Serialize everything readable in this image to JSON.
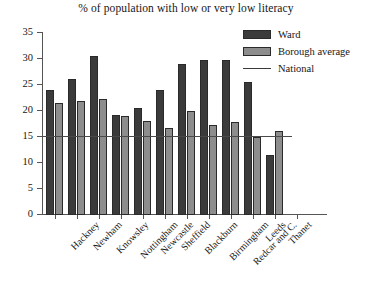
{
  "chart_data": {
    "type": "bar",
    "title": "% of population with low or very low literacy",
    "xlabel": "",
    "ylabel": "",
    "ylim": [
      0,
      35
    ],
    "ytick_step": 5,
    "yticks": [
      0,
      5,
      10,
      15,
      20,
      25,
      30,
      35
    ],
    "grid": false,
    "legend_position": "top-right",
    "categories": [
      "Hackney",
      "Newham",
      "Knowsley",
      "Nottingham",
      "Newcastle",
      "Sheffield",
      "Blackburn",
      "Birmingham",
      "Redcar and C.",
      "Leeds",
      "Thanet"
    ],
    "series": [
      {
        "name": "Ward",
        "color": "#3b3b3b",
        "values": [
          24.0,
          26.2,
          30.5,
          19.3,
          20.5,
          24.0,
          29.1,
          29.9,
          29.9,
          25.6,
          11.6
        ]
      },
      {
        "name": "Borough average",
        "color": "#8d8d8d",
        "values": [
          21.5,
          22.0,
          22.3,
          19.0,
          18.0,
          16.7,
          20.0,
          17.3,
          17.8,
          15.0,
          16.1
        ]
      }
    ],
    "reference_line": {
      "name": "National",
      "value": 15,
      "color": "#4a4a4a"
    }
  },
  "legend": {
    "items": [
      {
        "label": "Ward",
        "kind": "swatch-dark"
      },
      {
        "label": "Borough average",
        "kind": "swatch-gray"
      },
      {
        "label": "National",
        "kind": "line"
      }
    ]
  }
}
